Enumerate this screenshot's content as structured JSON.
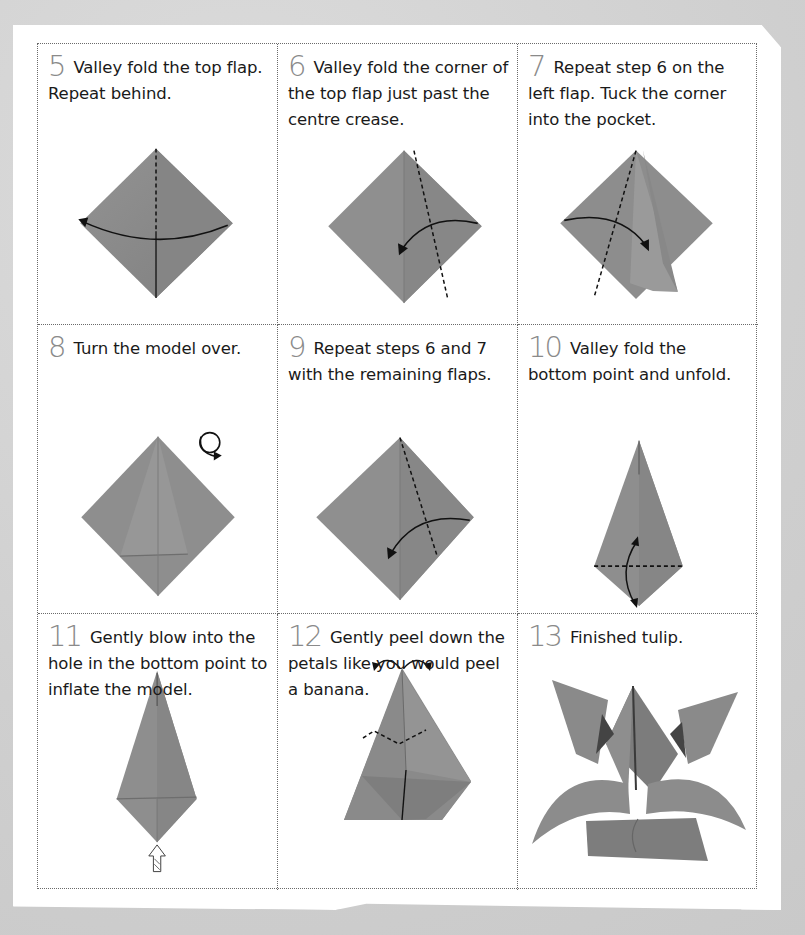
{
  "steps": [
    {
      "number": "5",
      "text": "Valley fold the top flap. Repeat behind.",
      "figure": "diamond-valley-fold-top-flap"
    },
    {
      "number": "6",
      "text": "Valley fold the corner of the top flap just past the centre crease.",
      "figure": "diamond-fold-right-corner"
    },
    {
      "number": "7",
      "text": "Repeat step 6 on the left flap. Tuck the corner into the pocket.",
      "figure": "diamond-tuck-left-corner"
    },
    {
      "number": "8",
      "text": "Turn the model over.",
      "figure": "turn-over-symbol"
    },
    {
      "number": "9",
      "text": "Repeat steps 6 and 7 with the remaining flaps.",
      "figure": "diamond-fold-right-corner"
    },
    {
      "number": "10",
      "text": "Valley fold the bottom point and unfold.",
      "figure": "kite-fold-unfold-bottom"
    },
    {
      "number": "11",
      "text": "Gently blow into the hole in the bottom point to inflate the model.",
      "figure": "kite-inflate-arrow"
    },
    {
      "number": "12",
      "text": "Gently peel down the petals like you would peel a banana.",
      "figure": "inflated-peel-petals"
    },
    {
      "number": "13",
      "text": "Finished tulip.",
      "figure": "finished-tulip"
    }
  ],
  "colors": {
    "paper_model": "#8c8c8c",
    "step_number": "#8a8a8a",
    "text": "#1a1a1a",
    "background": "#d4d4d4"
  }
}
